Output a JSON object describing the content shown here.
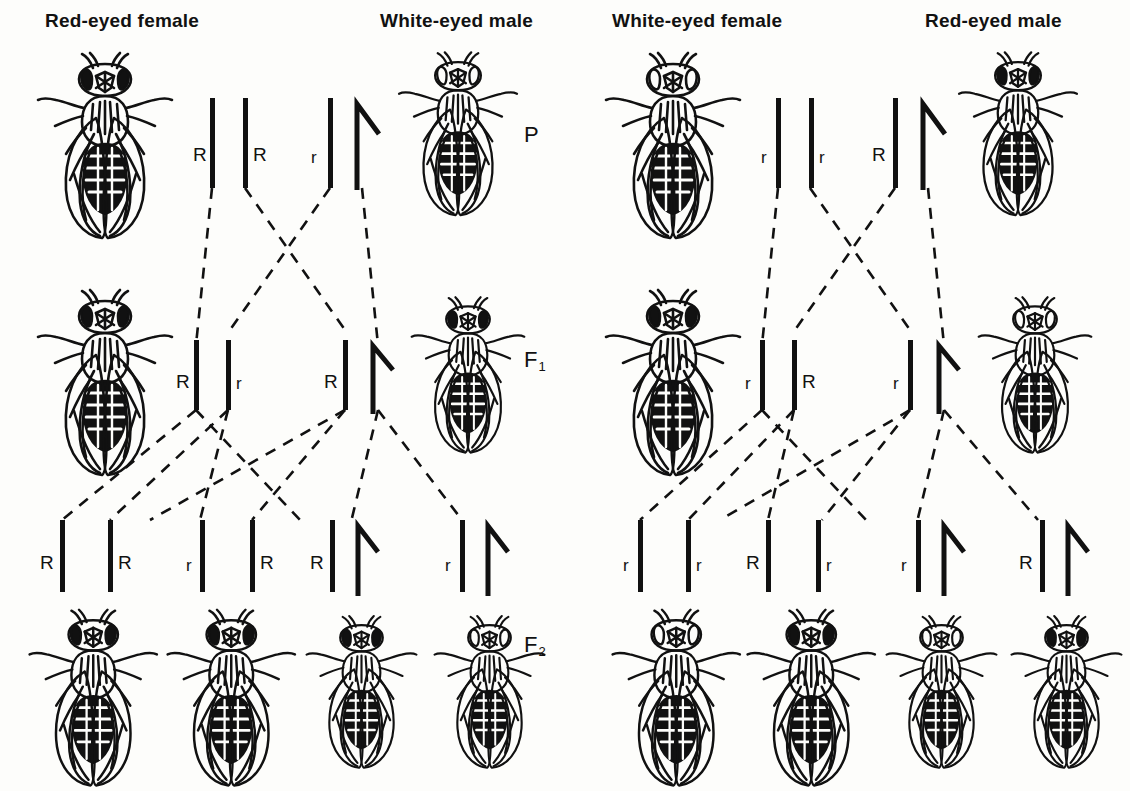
{
  "diagram": {
    "ink_color": "#111111",
    "background_color": "#fdfdfb"
  },
  "generation_labels": [
    {
      "name": "P",
      "text": "P",
      "sub": "",
      "x": 520,
      "y": 128
    },
    {
      "name": "F1",
      "text": "F",
      "sub": "1",
      "x": 520,
      "y": 355
    },
    {
      "name": "F2",
      "text": "F",
      "sub": "2",
      "x": 520,
      "y": 640
    }
  ],
  "crosses": [
    {
      "id": "cross-left",
      "headings": [
        {
          "label": "Red-eyed female",
          "x": 45,
          "y": 10
        },
        {
          "label": "White-eyed male",
          "x": 322,
          "y": 10
        }
      ],
      "P": {
        "female": {
          "eye": "red",
          "genotype": [
            "R",
            "R"
          ],
          "sex": "female"
        },
        "male": {
          "eye": "white",
          "genotype": [
            "r",
            "Y"
          ],
          "sex": "male"
        },
        "alleles": [
          "R",
          "R",
          "r",
          ""
        ]
      },
      "F1": {
        "female": {
          "eye": "red",
          "genotype": [
            "R",
            "r"
          ],
          "sex": "female"
        },
        "male": {
          "eye": "red",
          "genotype": [
            "R",
            "Y"
          ],
          "sex": "male"
        },
        "alleles": [
          "R",
          "r",
          "R",
          ""
        ]
      },
      "F2": [
        {
          "genotype": [
            "R",
            "R"
          ],
          "sex": "female",
          "eye": "red",
          "alleles": [
            "R",
            "R"
          ]
        },
        {
          "genotype": [
            "r",
            "R"
          ],
          "sex": "female",
          "eye": "red",
          "alleles": [
            "r",
            "R"
          ]
        },
        {
          "genotype": [
            "R",
            "Y"
          ],
          "sex": "male",
          "eye": "red",
          "alleles": [
            "R",
            ""
          ]
        },
        {
          "genotype": [
            "r",
            "Y"
          ],
          "sex": "male",
          "eye": "white",
          "alleles": [
            "r",
            ""
          ]
        }
      ]
    },
    {
      "id": "cross-right",
      "headings": [
        {
          "label": "White-eyed female",
          "x": 612,
          "y": 10
        },
        {
          "label": "Red-eyed male",
          "x": 917,
          "y": 10
        }
      ],
      "P": {
        "female": {
          "eye": "white",
          "genotype": [
            "r",
            "r"
          ],
          "sex": "female"
        },
        "male": {
          "eye": "red",
          "genotype": [
            "R",
            "Y"
          ],
          "sex": "male"
        },
        "alleles": [
          "r",
          "r",
          "R",
          ""
        ]
      },
      "F1": {
        "female": {
          "eye": "red",
          "genotype": [
            "r",
            "R"
          ],
          "sex": "female"
        },
        "male": {
          "eye": "white",
          "genotype": [
            "r",
            "Y"
          ],
          "sex": "male"
        },
        "alleles": [
          "r",
          "R",
          "r",
          ""
        ]
      },
      "F2": [
        {
          "genotype": [
            "r",
            "r"
          ],
          "sex": "female",
          "eye": "white",
          "alleles": [
            "r",
            "r"
          ]
        },
        {
          "genotype": [
            "R",
            "r"
          ],
          "sex": "female",
          "eye": "red",
          "alleles": [
            "R",
            "r"
          ]
        },
        {
          "genotype": [
            "r",
            "Y"
          ],
          "sex": "male",
          "eye": "white",
          "alleles": [
            "r",
            ""
          ]
        },
        {
          "genotype": [
            "R",
            "Y"
          ],
          "sex": "male",
          "eye": "red",
          "alleles": [
            "R",
            ""
          ]
        }
      ]
    }
  ]
}
